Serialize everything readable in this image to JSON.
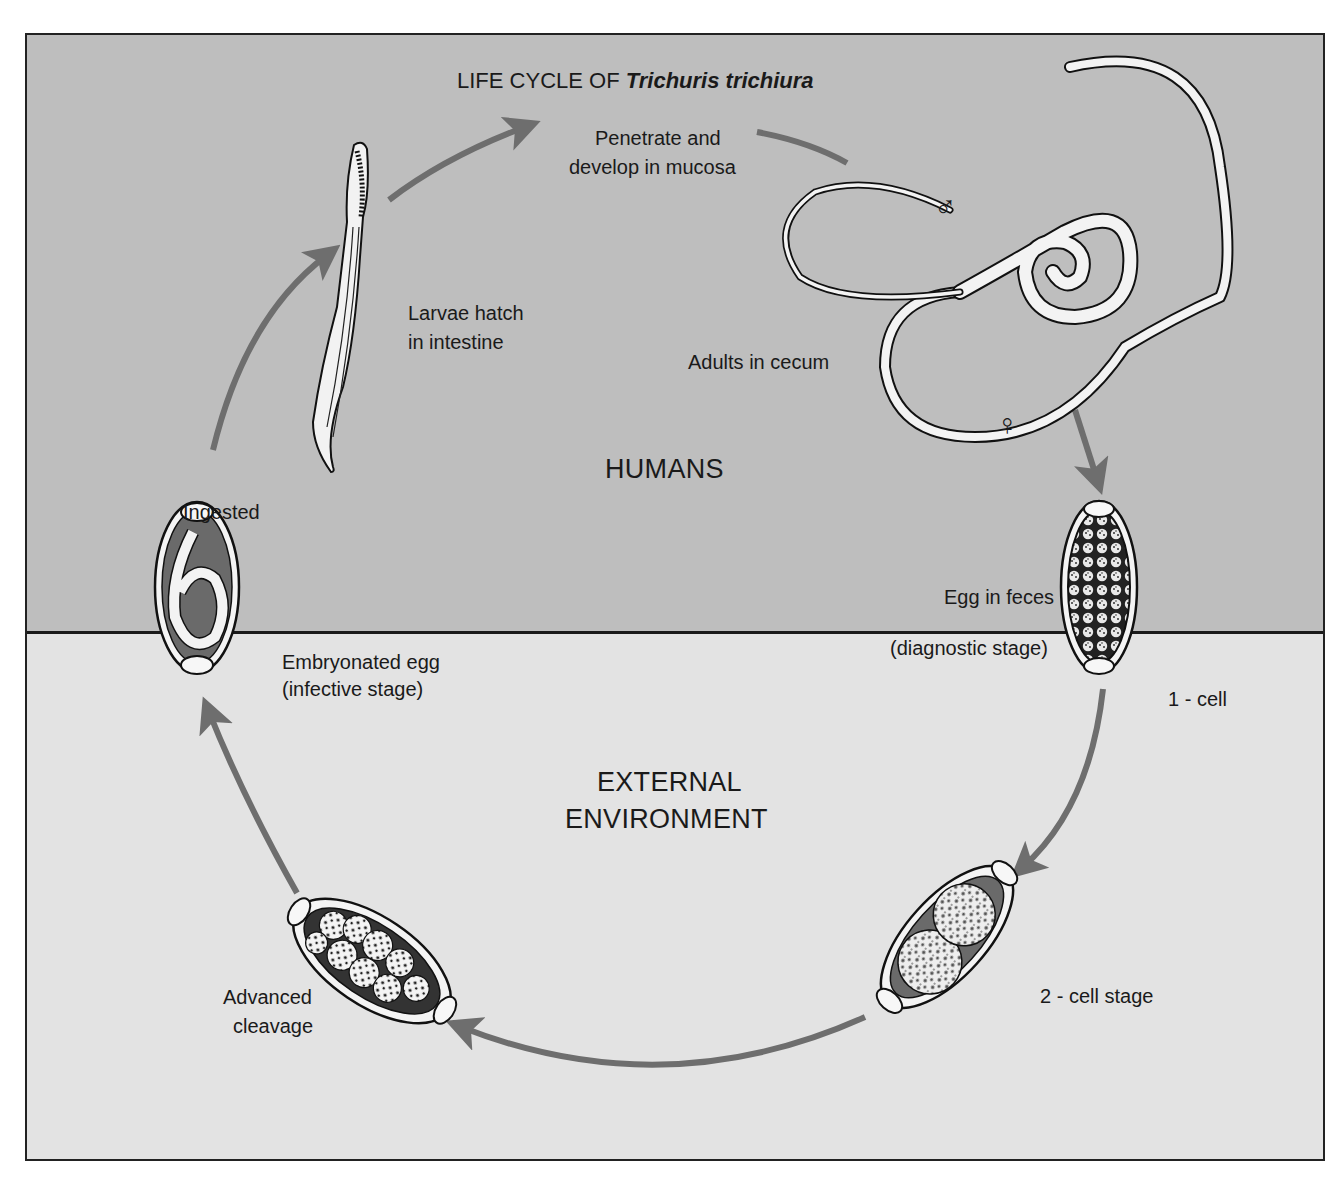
{
  "title": {
    "prefix": "LIFE CYCLE OF ",
    "species": "Trichuris trichiura"
  },
  "zones": {
    "humans": "HUMANS",
    "external_line1": "EXTERNAL",
    "external_line2": "ENVIRONMENT"
  },
  "stages": {
    "penetrate_line1": "Penetrate and",
    "penetrate_line2": "develop in mucosa",
    "larvae_line1": "Larvae hatch",
    "larvae_line2": "in intestine",
    "adults": "Adults in cecum",
    "male_symbol": "♂",
    "female_symbol": "♀",
    "ingested": "Ingested",
    "egg_feces_line1": "Egg in feces",
    "egg_feces_line2": "(diagnostic stage)",
    "one_cell": "1 - cell",
    "embryonated_line1": "Embryonated egg",
    "embryonated_line2": "(infective stage)",
    "two_cell": "2 - cell stage",
    "advanced_line1": "Advanced",
    "advanced_line2": "cleavage"
  },
  "colors": {
    "humans_bg": "#bebebe",
    "environment_bg": "#e3e3e3",
    "arrow": "#6e6e6e",
    "outline": "#1a1a1a",
    "egg_dark": "#6a6a6a"
  }
}
